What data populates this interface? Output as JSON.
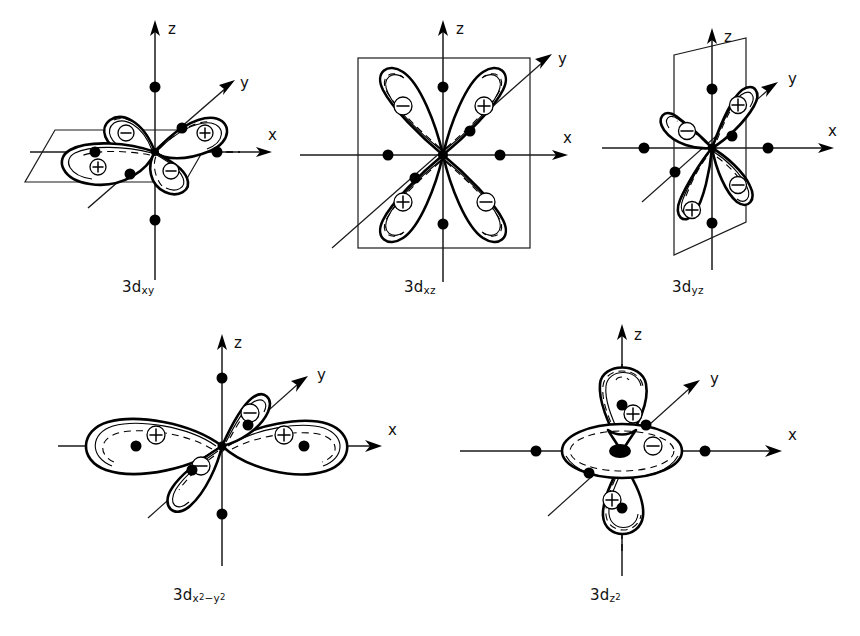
{
  "figure": {
    "background_color": "#ffffff",
    "ink_color": "#000000",
    "axis_labels": {
      "x": "x",
      "y": "y",
      "z": "z"
    },
    "sign_symbols": {
      "positive": "+",
      "negative": "−"
    }
  },
  "panels": [
    {
      "id": "dxy",
      "label_base": "3d",
      "label_sub": "xy",
      "label_full": "3d_xy",
      "frame": "parallelogram-horizontal-plane",
      "axes": [
        "z",
        "y",
        "x"
      ],
      "lobes": [
        {
          "position": "upper-left",
          "sign": "−"
        },
        {
          "position": "upper-right",
          "sign": "+"
        },
        {
          "position": "lower-left",
          "sign": "+"
        },
        {
          "position": "lower-right",
          "sign": "−"
        }
      ],
      "axis_dots": 6
    },
    {
      "id": "dxz",
      "label_base": "3d",
      "label_sub": "xz",
      "label_full": "3d_xz",
      "frame": "square-vertical-plane",
      "axes": [
        "z",
        "y",
        "x"
      ],
      "lobes": [
        {
          "position": "upper-left",
          "sign": "−"
        },
        {
          "position": "upper-right",
          "sign": "+"
        },
        {
          "position": "lower-left",
          "sign": "+"
        },
        {
          "position": "lower-right",
          "sign": "−"
        }
      ],
      "axis_dots": 4
    },
    {
      "id": "dyz",
      "label_base": "3d",
      "label_sub": "yz",
      "label_full": "3d_yz",
      "frame": "tilted-vertical-plane",
      "axes": [
        "z",
        "y",
        "x"
      ],
      "lobes": [
        {
          "position": "upper-right",
          "sign": "+"
        },
        {
          "position": "upper-left",
          "sign": "−"
        },
        {
          "position": "lower-right",
          "sign": "−"
        },
        {
          "position": "lower-left",
          "sign": "+"
        }
      ],
      "axis_dots": 6
    },
    {
      "id": "dx2-y2",
      "label_base": "3d",
      "label_sub_parts": [
        "x",
        "2",
        "−",
        "y",
        "2"
      ],
      "label_full": "3d_x2−y2",
      "frame": "none",
      "axes": [
        "z",
        "y",
        "x"
      ],
      "lobes": [
        {
          "position": "left-on-x",
          "sign": "+"
        },
        {
          "position": "right-on-x",
          "sign": "+"
        },
        {
          "position": "upper-right-on-y",
          "sign": "−"
        },
        {
          "position": "lower-left-on-y",
          "sign": "−"
        }
      ],
      "axis_dots": 6
    },
    {
      "id": "dz2",
      "label_base": "3d",
      "label_sub": "z",
      "label_sup": "2",
      "label_full": "3d_z2",
      "frame": "none",
      "axes": [
        "z",
        "y",
        "x"
      ],
      "lobes": [
        {
          "position": "top-on-z",
          "sign": "+"
        },
        {
          "position": "bottom-on-z",
          "sign": "+"
        },
        {
          "position": "torus-ring",
          "sign": "−"
        }
      ],
      "axis_dots": 6
    }
  ]
}
